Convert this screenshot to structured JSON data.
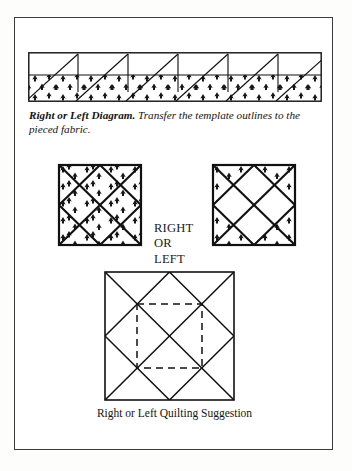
{
  "page": {
    "background_color": "#ffffff",
    "frame_color": "#3b3b3b",
    "ink_color": "#111111"
  },
  "strip_figure": {
    "name": "right-or-left-template-strip",
    "description": "Pieced fabric strip with plain top band and printed bottom band, overlaid with repeated right-triangle template outlines",
    "repeat_count": 5,
    "bands": [
      "plain",
      "printed"
    ]
  },
  "strip_caption": {
    "lead": "Right or Left Diagram.",
    "body": " Transfer the template outlines to the pieced fabric."
  },
  "blocks": {
    "left": {
      "name": "right-or-left-block-print",
      "description": "Square block, fully printed fabric, with both diagonals and an inner on-point square"
    },
    "right": {
      "name": "right-or-left-block-plain",
      "description": "Square block with print only in the four corner triangles, both diagonals and an inner on-point square"
    },
    "label_lines": [
      "RIGHT",
      "OR",
      "LEFT"
    ]
  },
  "quilting": {
    "name": "right-or-left-quilting-block",
    "description": "Large square block with diagonals, on-point inner square and dashed quilting square",
    "caption": "Right or Left Quilting Suggestion",
    "dashed_line_style": "dashed"
  }
}
